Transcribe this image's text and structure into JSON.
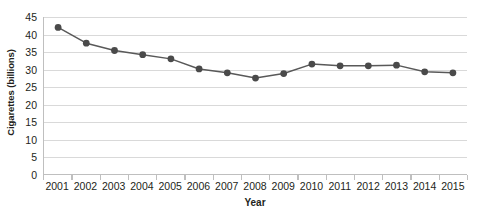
{
  "chart_data": {
    "type": "line",
    "title": "",
    "xlabel": "Year",
    "ylabel": "Cigarettes (billions)",
    "categories": [
      "2001",
      "2002",
      "2003",
      "2004",
      "2005",
      "2006",
      "2007",
      "2008",
      "2009",
      "2010",
      "2011",
      "2012",
      "2013",
      "2014",
      "2015"
    ],
    "values": [
      42.0,
      37.5,
      35.4,
      34.2,
      33.0,
      30.1,
      29.0,
      27.5,
      28.8,
      31.5,
      31.0,
      31.0,
      31.2,
      29.3,
      29.0
    ],
    "series": [
      {
        "name": "Cigarettes (billions)",
        "values": [
          42.0,
          37.5,
          35.4,
          34.2,
          33.0,
          30.1,
          29.0,
          27.5,
          28.8,
          31.5,
          31.0,
          31.0,
          31.2,
          29.3,
          29.0
        ]
      }
    ],
    "ylim": [
      0,
      45
    ],
    "ytick_step": 5,
    "yticks": [
      45,
      40,
      35,
      30,
      25,
      20,
      15,
      10,
      5,
      0
    ],
    "xticks": [
      "2001",
      "2002",
      "2003",
      "2004",
      "2005",
      "2006",
      "2007",
      "2008",
      "2009",
      "2010",
      "2011",
      "2012",
      "2013",
      "2014",
      "2015"
    ],
    "grid": true,
    "grid_axis": "y",
    "legend": false,
    "legend_position": "none",
    "marker": "circle",
    "line_color": "#595959",
    "marker_color": "#4a4a4a",
    "grid_color": "#d9d9d9",
    "axis_color": "#bfbfbf",
    "text_color": "#231f20",
    "background_color": "#ffffff"
  }
}
